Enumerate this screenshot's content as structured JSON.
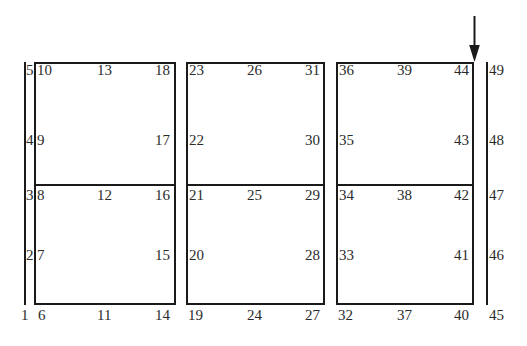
{
  "figure": {
    "background_color": "#ffffff",
    "line_color": "#1a1a1a",
    "text_color": "#2b2b2b"
  },
  "chart_data": {
    "type": "diagram",
    "title": "",
    "node_count": 49,
    "columns": [
      {
        "id": "col-1",
        "x": 24,
        "nodes": [
          1,
          2,
          3,
          4,
          5
        ]
      },
      {
        "id": "col-2",
        "x": 36,
        "nodes": [
          6,
          7,
          8,
          9,
          10
        ]
      },
      {
        "id": "col-3",
        "x": 105,
        "nodes": [
          11,
          12,
          13
        ]
      },
      {
        "id": "col-4",
        "x": 173,
        "nodes": [
          14,
          15,
          16,
          17,
          18
        ]
      },
      {
        "id": "col-5",
        "x": 188,
        "nodes": [
          19,
          20,
          21,
          22,
          23
        ]
      },
      {
        "id": "col-6",
        "x": 256,
        "nodes": [
          24,
          25,
          26
        ]
      },
      {
        "id": "col-7",
        "x": 322,
        "nodes": [
          27,
          28,
          29,
          30,
          31
        ]
      },
      {
        "id": "col-8",
        "x": 338,
        "nodes": [
          32,
          33,
          34,
          35,
          36
        ]
      },
      {
        "id": "col-9",
        "x": 406,
        "nodes": [
          37,
          38,
          39
        ]
      },
      {
        "id": "col-10",
        "x": 472,
        "nodes": [
          40,
          41,
          42,
          43,
          44
        ]
      },
      {
        "id": "col-11",
        "x": 486,
        "nodes": [
          45,
          46,
          47,
          48,
          49
        ]
      }
    ],
    "rows_y": {
      "bottom": 315,
      "lower_mid": 255,
      "middle": 196,
      "upper_mid": 140,
      "top": 70
    }
  },
  "lines": {
    "left_rail": {
      "name": "left-boundary-line",
      "x": 24,
      "y": 62,
      "height": 243
    },
    "right_rail": {
      "name": "right-boundary-line",
      "x": 486,
      "y": 62,
      "height": 243
    }
  },
  "boxes": [
    {
      "id": "panel-1",
      "x": 34,
      "y": 62,
      "width": 142,
      "height": 243,
      "divider_y": 185
    },
    {
      "id": "panel-2",
      "x": 186,
      "y": 62,
      "width": 139,
      "height": 243,
      "divider_y": 185
    },
    {
      "id": "panel-3",
      "x": 336,
      "y": 62,
      "width": 138,
      "height": 243,
      "divider_y": 185
    }
  ],
  "arrow": {
    "name": "load-direction-arrow",
    "direction": "down",
    "tip_x": 474,
    "tip_y": 62,
    "tail_y": 16
  },
  "labels": [
    {
      "n": "5",
      "x": 26,
      "y": 63,
      "align": "left"
    },
    {
      "n": "4",
      "x": 26,
      "y": 133,
      "align": "left"
    },
    {
      "n": "3",
      "x": 26,
      "y": 188,
      "align": "left"
    },
    {
      "n": "2",
      "x": 26,
      "y": 248,
      "align": "left"
    },
    {
      "n": "1",
      "x": 21,
      "y": 308,
      "align": "left"
    },
    {
      "n": "10",
      "x": 37,
      "y": 63,
      "align": "left"
    },
    {
      "n": "9",
      "x": 37,
      "y": 133,
      "align": "left"
    },
    {
      "n": "8",
      "x": 37,
      "y": 188,
      "align": "left"
    },
    {
      "n": "7",
      "x": 37,
      "y": 248,
      "align": "left"
    },
    {
      "n": "6",
      "x": 38,
      "y": 308,
      "align": "left"
    },
    {
      "n": "13",
      "x": 97,
      "y": 63,
      "align": "left"
    },
    {
      "n": "12",
      "x": 97,
      "y": 188,
      "align": "left"
    },
    {
      "n": "11",
      "x": 97,
      "y": 308,
      "align": "left"
    },
    {
      "n": "18",
      "x": 155,
      "y": 63,
      "align": "left"
    },
    {
      "n": "17",
      "x": 155,
      "y": 133,
      "align": "left"
    },
    {
      "n": "16",
      "x": 155,
      "y": 188,
      "align": "left"
    },
    {
      "n": "15",
      "x": 155,
      "y": 248,
      "align": "left"
    },
    {
      "n": "14",
      "x": 155,
      "y": 308,
      "align": "left"
    },
    {
      "n": "23",
      "x": 189,
      "y": 63,
      "align": "left"
    },
    {
      "n": "22",
      "x": 189,
      "y": 133,
      "align": "left"
    },
    {
      "n": "21",
      "x": 189,
      "y": 188,
      "align": "left"
    },
    {
      "n": "20",
      "x": 189,
      "y": 248,
      "align": "left"
    },
    {
      "n": "19",
      "x": 188,
      "y": 308,
      "align": "left"
    },
    {
      "n": "26",
      "x": 247,
      "y": 63,
      "align": "left"
    },
    {
      "n": "25",
      "x": 247,
      "y": 188,
      "align": "left"
    },
    {
      "n": "24",
      "x": 247,
      "y": 308,
      "align": "left"
    },
    {
      "n": "31",
      "x": 305,
      "y": 63,
      "align": "left"
    },
    {
      "n": "30",
      "x": 305,
      "y": 133,
      "align": "left"
    },
    {
      "n": "29",
      "x": 305,
      "y": 188,
      "align": "left"
    },
    {
      "n": "28",
      "x": 305,
      "y": 248,
      "align": "left"
    },
    {
      "n": "27",
      "x": 305,
      "y": 308,
      "align": "left"
    },
    {
      "n": "36",
      "x": 339,
      "y": 63,
      "align": "left"
    },
    {
      "n": "35",
      "x": 339,
      "y": 133,
      "align": "left"
    },
    {
      "n": "34",
      "x": 339,
      "y": 188,
      "align": "left"
    },
    {
      "n": "33",
      "x": 339,
      "y": 248,
      "align": "left"
    },
    {
      "n": "32",
      "x": 338,
      "y": 308,
      "align": "left"
    },
    {
      "n": "39",
      "x": 397,
      "y": 63,
      "align": "left"
    },
    {
      "n": "38",
      "x": 397,
      "y": 188,
      "align": "left"
    },
    {
      "n": "37",
      "x": 397,
      "y": 308,
      "align": "left"
    },
    {
      "n": "44",
      "x": 454,
      "y": 63,
      "align": "left"
    },
    {
      "n": "43",
      "x": 454,
      "y": 133,
      "align": "left"
    },
    {
      "n": "42",
      "x": 454,
      "y": 188,
      "align": "left"
    },
    {
      "n": "41",
      "x": 454,
      "y": 248,
      "align": "left"
    },
    {
      "n": "40",
      "x": 454,
      "y": 308,
      "align": "left"
    },
    {
      "n": "49",
      "x": 489,
      "y": 63,
      "align": "left"
    },
    {
      "n": "48",
      "x": 489,
      "y": 133,
      "align": "left"
    },
    {
      "n": "47",
      "x": 489,
      "y": 188,
      "align": "left"
    },
    {
      "n": "46",
      "x": 489,
      "y": 248,
      "align": "left"
    },
    {
      "n": "45",
      "x": 489,
      "y": 308,
      "align": "left"
    }
  ]
}
